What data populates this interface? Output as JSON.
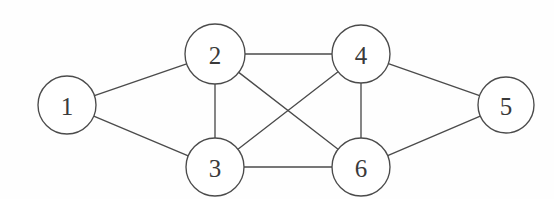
{
  "diagram": {
    "type": "undirected-graph",
    "title": "",
    "background_color": "#fefefe",
    "stroke_color": "#4b4b4b",
    "node_fill_color": "#ffffff",
    "label_color": "#3a3a3a",
    "node_radius": 29,
    "canvas": {
      "width": 554,
      "height": 199
    },
    "nodes": [
      {
        "id": "1",
        "label": "1",
        "cx": 67,
        "cy": 105,
        "r": 29
      },
      {
        "id": "2",
        "label": "2",
        "cx": 215,
        "cy": 54,
        "r": 30
      },
      {
        "id": "3",
        "label": "3",
        "cx": 215,
        "cy": 167,
        "r": 29
      },
      {
        "id": "4",
        "label": "4",
        "cx": 361,
        "cy": 54,
        "r": 29
      },
      {
        "id": "5",
        "label": "5",
        "cx": 506,
        "cy": 105,
        "r": 28
      },
      {
        "id": "6",
        "label": "6",
        "cx": 361,
        "cy": 167,
        "r": 29
      }
    ],
    "edges": [
      {
        "from": "1",
        "to": "2"
      },
      {
        "from": "1",
        "to": "3"
      },
      {
        "from": "2",
        "to": "3"
      },
      {
        "from": "2",
        "to": "4"
      },
      {
        "from": "2",
        "to": "6"
      },
      {
        "from": "3",
        "to": "4"
      },
      {
        "from": "3",
        "to": "6"
      },
      {
        "from": "4",
        "to": "5"
      },
      {
        "from": "4",
        "to": "6"
      },
      {
        "from": "5",
        "to": "6"
      }
    ],
    "edge_count": 10,
    "node_count": 6
  }
}
